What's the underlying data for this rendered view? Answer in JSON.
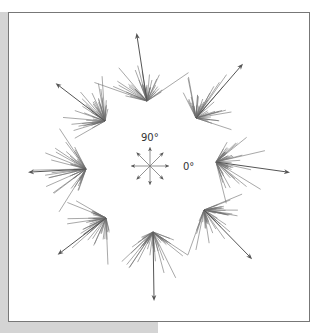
{
  "figure": {
    "legend": {
      "label_90": "90°",
      "label_0": "0°"
    },
    "line_color": "#6e6e6e",
    "arrow_color": "#555555"
  },
  "bundles": [
    {
      "direction_deg": 90,
      "cx": 147,
      "cy": 101,
      "ax": 137,
      "ay": 36
    },
    {
      "direction_deg": 45,
      "cx": 196,
      "cy": 118,
      "ax": 241,
      "ay": 66
    },
    {
      "direction_deg": 0,
      "cx": 216,
      "cy": 162,
      "ax": 287,
      "ay": 172
    },
    {
      "direction_deg": -45,
      "cx": 204,
      "cy": 210,
      "ax": 250,
      "ay": 257
    },
    {
      "direction_deg": -90,
      "cx": 153,
      "cy": 232,
      "ax": 154,
      "ay": 298
    },
    {
      "direction_deg": -135,
      "cx": 106,
      "cy": 218,
      "ax": 60,
      "ay": 253
    },
    {
      "direction_deg": 180,
      "cx": 86,
      "cy": 169,
      "ax": 31,
      "ay": 172
    },
    {
      "direction_deg": 135,
      "cx": 105,
      "cy": 121,
      "ax": 58,
      "ay": 85
    }
  ]
}
